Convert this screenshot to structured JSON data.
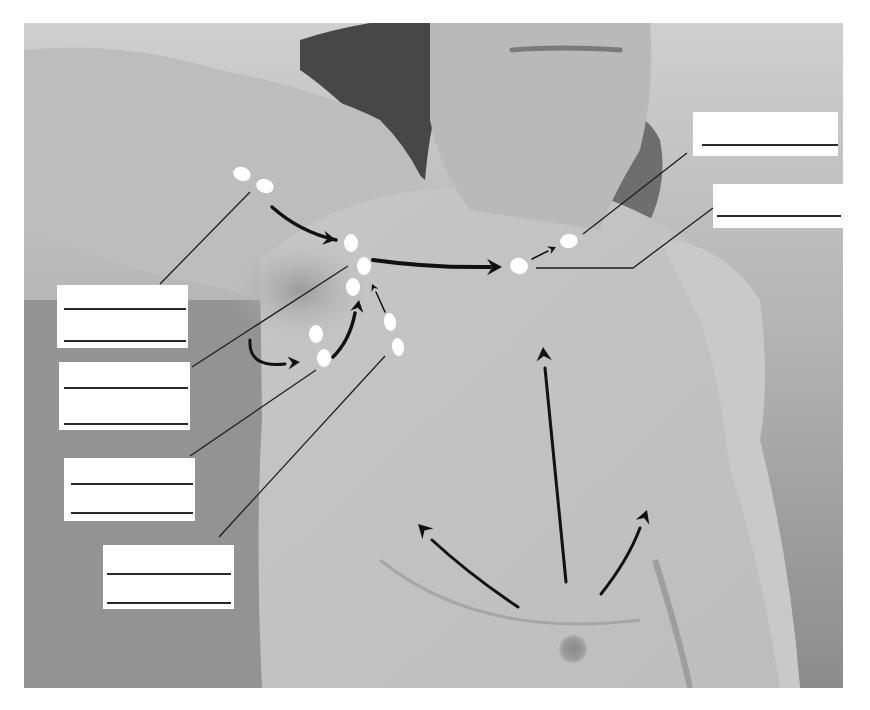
{
  "figure": {
    "photo": {
      "x": 24,
      "y": 23,
      "width": 819,
      "height": 665
    },
    "colors": {
      "background": "#ffffff",
      "backdrop_light": "#c9c9c9",
      "backdrop_dark": "#8f8f8f",
      "skin": "#bdbdbd",
      "skin_light": "#c8c8c8",
      "hair": "#4a4a4a",
      "node": "#ffffff",
      "arrow": "#111111",
      "leader": "#1e1e1e",
      "label_box": "#ffffff",
      "label_line": "#2a2a2a"
    }
  },
  "nodes": [
    {
      "id": "lateral-1",
      "cx": 242,
      "cy": 174,
      "rx": 9,
      "ry": 7,
      "rot": 20
    },
    {
      "id": "lateral-2",
      "cx": 265,
      "cy": 186,
      "rx": 9,
      "ry": 7,
      "rot": 20
    },
    {
      "id": "central-1",
      "cx": 351,
      "cy": 243,
      "rx": 7,
      "ry": 9,
      "rot": 0
    },
    {
      "id": "central-2",
      "cx": 364,
      "cy": 266,
      "rx": 7,
      "ry": 9,
      "rot": 0
    },
    {
      "id": "central-3",
      "cx": 353,
      "cy": 287,
      "rx": 7,
      "ry": 9,
      "rot": 0
    },
    {
      "id": "subscapular-1",
      "cx": 316,
      "cy": 334,
      "rx": 7,
      "ry": 9,
      "rot": 0
    },
    {
      "id": "subscapular-2",
      "cx": 324,
      "cy": 358,
      "rx": 7,
      "ry": 9,
      "rot": 0
    },
    {
      "id": "pectoral-1",
      "cx": 390,
      "cy": 322,
      "rx": 6,
      "ry": 9,
      "rot": -10
    },
    {
      "id": "pectoral-2",
      "cx": 398,
      "cy": 347,
      "rx": 6,
      "ry": 9,
      "rot": -10
    },
    {
      "id": "apical",
      "cx": 519,
      "cy": 266,
      "rx": 9,
      "ry": 8,
      "rot": 20
    },
    {
      "id": "supraclavicular",
      "cx": 569,
      "cy": 241,
      "rx": 9,
      "ry": 7,
      "rot": -10
    }
  ],
  "arrows": [
    {
      "id": "lateral-to-central",
      "path": "M272,207 Q300,232 336,240",
      "head": [
        336,
        240
      ],
      "angle": 10,
      "size": 13,
      "width": 3.5
    },
    {
      "id": "central-to-apical",
      "path": "M373,260 Q430,268 490,267",
      "head": [
        502,
        267
      ],
      "angle": 0,
      "size": 15,
      "width": 4
    },
    {
      "id": "apical-to-supraclav",
      "path": "M532,259 L548,251",
      "head": [
        556,
        247
      ],
      "angle": -25,
      "size": 8,
      "width": 1.5
    },
    {
      "id": "subscap-curve-in",
      "path": "M250,340 Q248,368 285,364",
      "head": [
        300,
        362
      ],
      "angle": -5,
      "size": 12,
      "width": 3
    },
    {
      "id": "subscap-to-central",
      "path": "M333,357 Q350,340 355,313",
      "head": [
        359,
        300
      ],
      "angle": -80,
      "size": 12,
      "width": 3.5
    },
    {
      "id": "pectoral-to-central",
      "path": "M385,312 L376,292",
      "head": [
        372,
        284
      ],
      "angle": -115,
      "size": 7,
      "width": 1.5
    },
    {
      "id": "breast-upper",
      "path": "M566,582 L545,368",
      "head": [
        543,
        347
      ],
      "angle": -95,
      "size": 14,
      "width": 3
    },
    {
      "id": "breast-medial",
      "path": "M518,607 Q470,575 432,540",
      "head": [
        418,
        524
      ],
      "angle": -135,
      "size": 14,
      "width": 3
    },
    {
      "id": "breast-lateral",
      "path": "M601,594 Q628,560 640,528",
      "head": [
        647,
        510
      ],
      "angle": -70,
      "size": 13,
      "width": 3
    }
  ],
  "leaders": [
    {
      "id": "leader-lateral",
      "points": "250,192 160,284"
    },
    {
      "id": "leader-central",
      "points": "348,266 192,367"
    },
    {
      "id": "leader-subscapular",
      "points": "316,370 190,456"
    },
    {
      "id": "leader-pectoral",
      "points": "385,356 219,537"
    },
    {
      "id": "leader-apical",
      "points": "536,268 633,268 713,208"
    },
    {
      "id": "leader-supraclav",
      "points": "583,234 687,153"
    }
  ],
  "labels": [
    {
      "id": "label-lateral",
      "x": 57,
      "y": 285,
      "w": 131,
      "h": 63,
      "lines": [
        309,
        341
      ],
      "line_x": [
        64,
        186
      ],
      "text": ""
    },
    {
      "id": "label-central",
      "x": 59,
      "y": 362,
      "w": 131,
      "h": 68,
      "lines": [
        388,
        424
      ],
      "line_x": [
        64,
        188
      ],
      "text": ""
    },
    {
      "id": "label-subscapular",
      "x": 64,
      "y": 458,
      "w": 131,
      "h": 63,
      "lines": [
        484,
        513
      ],
      "line_x": [
        71,
        193
      ],
      "text": ""
    },
    {
      "id": "label-pectoral",
      "x": 103,
      "y": 545,
      "w": 131,
      "h": 64,
      "lines": [
        574,
        603
      ],
      "line_x": [
        107,
        231
      ],
      "text": ""
    },
    {
      "id": "label-supraclavicular",
      "x": 693,
      "y": 112,
      "w": 145,
      "h": 44,
      "lines": [
        145
      ],
      "line_x": [
        702,
        838
      ],
      "text": ""
    },
    {
      "id": "label-apical",
      "x": 713,
      "y": 184,
      "w": 130,
      "h": 44,
      "lines": [
        216
      ],
      "line_x": [
        717,
        841
      ],
      "text": ""
    }
  ]
}
